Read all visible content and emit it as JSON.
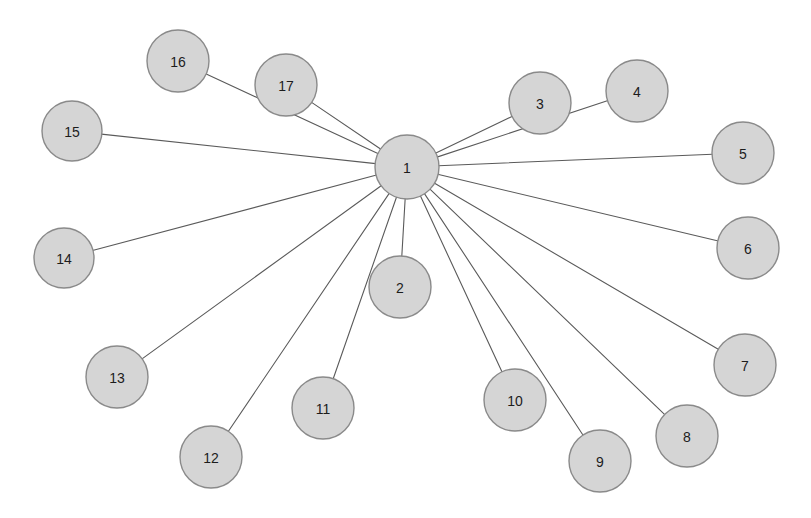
{
  "diagram": {
    "type": "node-link-graph",
    "topology": "star",
    "title": "",
    "background_color": "#ffffff",
    "hub_node_id": "1",
    "node_count": 17,
    "edge_count": 16,
    "style": {
      "node_fill": "#d5d5d5",
      "node_stroke": "#8a8a8a",
      "node_stroke_width": 1.4,
      "edge_stroke": "#5a5a5a",
      "edge_stroke_width": 1.1,
      "label_color": "#1c1c1c",
      "label_font_size": 14
    },
    "nodes": [
      {
        "id": "1",
        "label": "1",
        "cx": 407,
        "cy": 167,
        "r": 32
      },
      {
        "id": "2",
        "label": "2",
        "cx": 400,
        "cy": 287,
        "r": 31
      },
      {
        "id": "3",
        "label": "3",
        "cx": 540,
        "cy": 103,
        "r": 31
      },
      {
        "id": "4",
        "label": "4",
        "cx": 637,
        "cy": 91,
        "r": 31
      },
      {
        "id": "5",
        "label": "5",
        "cx": 743,
        "cy": 153,
        "r": 31
      },
      {
        "id": "6",
        "label": "6",
        "cx": 748,
        "cy": 248,
        "r": 31
      },
      {
        "id": "7",
        "label": "7",
        "cx": 745,
        "cy": 365,
        "r": 31
      },
      {
        "id": "8",
        "label": "8",
        "cx": 687,
        "cy": 436,
        "r": 31
      },
      {
        "id": "9",
        "label": "9",
        "cx": 600,
        "cy": 461,
        "r": 31
      },
      {
        "id": "10",
        "label": "10",
        "cx": 515,
        "cy": 400,
        "r": 31
      },
      {
        "id": "11",
        "label": "11",
        "cx": 323,
        "cy": 408,
        "r": 31
      },
      {
        "id": "12",
        "label": "12",
        "cx": 211,
        "cy": 457,
        "r": 31
      },
      {
        "id": "13",
        "label": "13",
        "cx": 117,
        "cy": 377,
        "r": 31
      },
      {
        "id": "14",
        "label": "14",
        "cx": 64,
        "cy": 258,
        "r": 30
      },
      {
        "id": "15",
        "label": "15",
        "cx": 72,
        "cy": 131,
        "r": 30
      },
      {
        "id": "16",
        "label": "16",
        "cx": 178,
        "cy": 61,
        "r": 31
      },
      {
        "id": "17",
        "label": "17",
        "cx": 286,
        "cy": 85,
        "r": 31
      }
    ],
    "edges": [
      {
        "source": "1",
        "target": "2"
      },
      {
        "source": "1",
        "target": "3"
      },
      {
        "source": "1",
        "target": "4"
      },
      {
        "source": "1",
        "target": "5"
      },
      {
        "source": "1",
        "target": "6"
      },
      {
        "source": "1",
        "target": "7"
      },
      {
        "source": "1",
        "target": "8"
      },
      {
        "source": "1",
        "target": "9"
      },
      {
        "source": "1",
        "target": "10"
      },
      {
        "source": "1",
        "target": "11"
      },
      {
        "source": "1",
        "target": "12"
      },
      {
        "source": "1",
        "target": "13"
      },
      {
        "source": "1",
        "target": "14"
      },
      {
        "source": "1",
        "target": "15"
      },
      {
        "source": "1",
        "target": "16"
      },
      {
        "source": "1",
        "target": "17"
      }
    ]
  }
}
